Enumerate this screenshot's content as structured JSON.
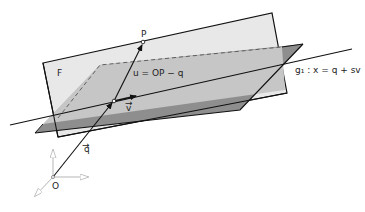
{
  "diagram": {
    "plane_label": "F",
    "point_P": "P",
    "origin": "O",
    "vector_q": "q",
    "vector_v": "v",
    "vector_u_expression": "u = OP − q",
    "line_label": "g₁ : x = q + sv",
    "colors": {
      "plane_F": "#e6e6e6",
      "plane_dark": "#8e8e8e",
      "plane_overlap": "#c4c4c4",
      "axes": "#b5b5b5",
      "lines": "#111111"
    }
  }
}
